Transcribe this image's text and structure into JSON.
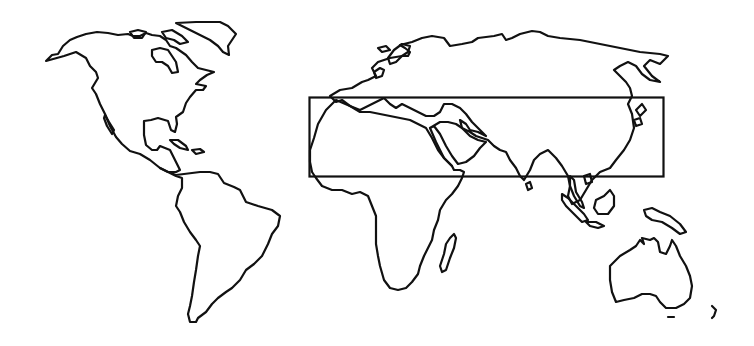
{
  "map": {
    "style": "black outline world map on white",
    "background_color": "#ffffff",
    "stroke_color": "#111111",
    "continents": [
      {
        "name": "North America"
      },
      {
        "name": "Greenland"
      },
      {
        "name": "Central America & Caribbean"
      },
      {
        "name": "South America"
      },
      {
        "name": "Europe"
      },
      {
        "name": "Asia"
      },
      {
        "name": "Africa"
      },
      {
        "name": "Madagascar"
      },
      {
        "name": "Arabian Peninsula"
      },
      {
        "name": "India"
      },
      {
        "name": "Southeast Asia & Indonesia"
      },
      {
        "name": "Japan"
      },
      {
        "name": "New Guinea"
      },
      {
        "name": "Australia"
      },
      {
        "name": "New Zealand"
      }
    ],
    "highlighted_region": {
      "description": "rectangular band from West Africa to East Asia",
      "approx_lat_range_deg": [
        10,
        40
      ],
      "approx_lon_range_deg": [
        -20,
        145
      ]
    }
  }
}
